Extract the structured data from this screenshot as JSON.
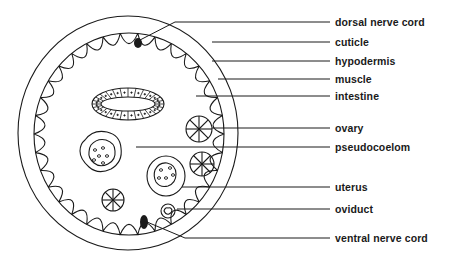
{
  "diagram": {
    "labels": [
      {
        "id": "dorsal-nerve-cord",
        "text": "dorsal nerve cord",
        "y": 22
      },
      {
        "id": "cuticle",
        "text": "cuticle",
        "y": 42
      },
      {
        "id": "hypodermis",
        "text": "hypodermis",
        "y": 61
      },
      {
        "id": "muscle",
        "text": "muscle",
        "y": 79
      },
      {
        "id": "intestine",
        "text": "intestine",
        "y": 96
      },
      {
        "id": "ovary",
        "text": "ovary",
        "y": 128
      },
      {
        "id": "pseudocoelom",
        "text": "pseudocoelom",
        "y": 147
      },
      {
        "id": "uterus",
        "text": "uterus",
        "y": 187
      },
      {
        "id": "oviduct",
        "text": "oviduct",
        "y": 209
      },
      {
        "id": "ventral-nerve-cord",
        "text": "ventral nerve cord",
        "y": 238
      }
    ],
    "colors": {
      "line": "#1a1a1a",
      "background": "#ffffff"
    }
  }
}
